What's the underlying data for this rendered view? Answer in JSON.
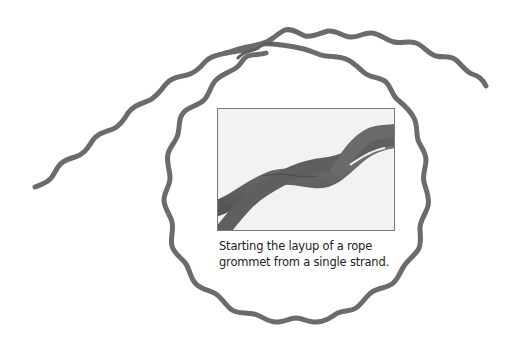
{
  "figure": {
    "caption_lines": [
      "Starting the layup of a rope",
      "grommet from a single strand."
    ],
    "colors": {
      "strand": "#6b6b6b",
      "inset_background": "#f2f2f2",
      "inset_border": "#7a7a7a",
      "caption_text": "#222222"
    },
    "illustration": "rope-strand-loop",
    "inset_photo": "laid-up-strands-photo"
  }
}
